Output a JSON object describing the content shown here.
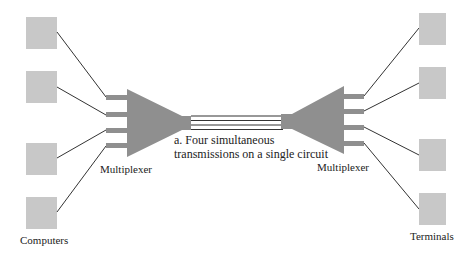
{
  "labels": {
    "computers": "Computers",
    "terminals": "Terminals",
    "mux_left": "Multiplexer",
    "mux_right": "Multiplexer",
    "caption_line1": "a.  Four simultaneous",
    "caption_line2": "transmissions on a single circuit"
  },
  "colors": {
    "device_fill": "#c8c8c8",
    "mux_fill": "#8f8f8f",
    "line": "#333333",
    "background": "#ffffff"
  },
  "devices": {
    "computers_count": 4,
    "terminals_count": 4,
    "circuit_channels": 4
  }
}
